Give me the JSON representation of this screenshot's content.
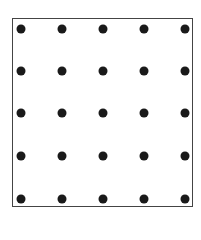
{
  "diagram": {
    "type": "dot-grid",
    "rows": 5,
    "cols": 5,
    "frame": {
      "left": 12,
      "top": 18,
      "width": 181,
      "height": 189,
      "border_color": "#444444"
    },
    "dot_color": "#1a1a1a",
    "x_positions": [
      21,
      62,
      103,
      144,
      185
    ],
    "y_positions": [
      29,
      71,
      113,
      156,
      199
    ]
  }
}
